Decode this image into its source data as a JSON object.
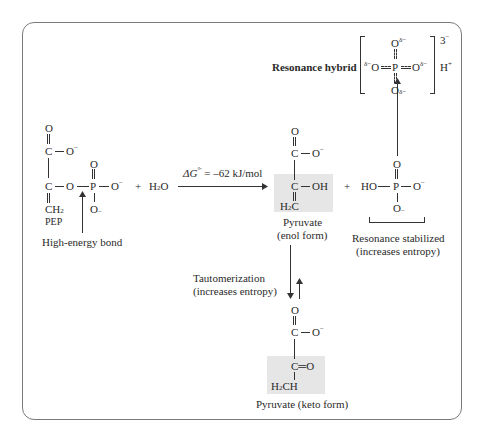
{
  "figure": {
    "pep": {
      "name_label": "PEP",
      "atoms": {
        "o_top": "O",
        "c1": "C",
        "o_minus_1": "O",
        "c2": "C",
        "o_bridge": "O",
        "p": "P",
        "o_p_top": "O",
        "o_p_right": "O",
        "o_p_bottom": "O",
        "ch2": "CH",
        "ch2_sub": "2"
      },
      "charges": {
        "minus": "−",
        "minus_bottom": "–"
      },
      "annotation": "High-energy bond"
    },
    "plus_1": "+",
    "water": {
      "h": "H",
      "sub": "2",
      "o": "O"
    },
    "reaction_arrow": {
      "label_delta_g": "ΔG",
      "label_superscript": "°'",
      "label_value": " = –62 kJ/mol"
    },
    "pyruvate_enol": {
      "atoms": {
        "o_top": "O",
        "c1": "C",
        "o_minus": "O",
        "c2": "C",
        "oh": "OH",
        "h2c_h": "H",
        "h2c_sub": "2",
        "h2c_c": "C"
      },
      "label_line1": "Pyruvate",
      "label_line2": "(enol form)"
    },
    "plus_2": "+",
    "phosphate": {
      "atoms": {
        "o_top": "O",
        "ho": "HO",
        "p": "P",
        "o_right": "O",
        "o_bottom": "O"
      },
      "label_line1": "Resonance stabilized",
      "label_line2": "(increases entropy)"
    },
    "resonance_hybrid": {
      "label": "Resonance hybrid",
      "atoms": {
        "o_top": "O",
        "o_left": "O",
        "p": "P",
        "o_right": "O",
        "o_bottom": "O"
      },
      "delta_minus": "δ−",
      "bracket_charge": "3",
      "bracket_charge_sign": "−",
      "proton": "H",
      "proton_charge": "+"
    },
    "tautomerization": {
      "label_line1": "Tautomerization",
      "label_line2": "(increases entropy)"
    },
    "pyruvate_keto": {
      "atoms": {
        "o_top": "O",
        "c1": "C",
        "o_minus": "O",
        "c2_double_o": "C═O",
        "h2ch_h": "H",
        "h2ch_sub": "2",
        "h2ch_ch": "CH"
      },
      "label": "Pyruvate (keto form)"
    }
  }
}
